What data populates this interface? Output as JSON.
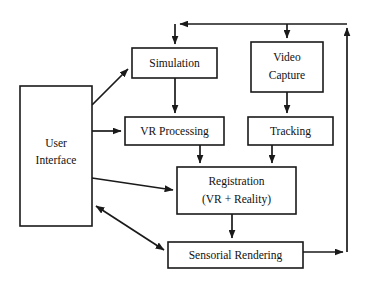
{
  "diagram": {
    "type": "block-flow-diagram",
    "canvas": {
      "width": 368,
      "height": 283,
      "background": "#ffffff"
    },
    "style": {
      "line_color": "#1a1a1a",
      "box_fill": "#ffffff",
      "text_color": "#111111"
    },
    "nodes": [
      {
        "id": "user-interface",
        "label": "User\nInterface",
        "line1": "User",
        "line2": "Interface",
        "x": 20,
        "y": 86,
        "w": 72,
        "h": 140
      },
      {
        "id": "simulation",
        "label": "Simulation",
        "line1": "Simulation",
        "line2": "",
        "x": 132,
        "y": 48,
        "w": 85,
        "h": 30
      },
      {
        "id": "video-capture",
        "label": "Video\nCapture",
        "line1": "Video",
        "line2": "Capture",
        "x": 251,
        "y": 42,
        "w": 72,
        "h": 50
      },
      {
        "id": "vr-processing",
        "label": "VR Processing",
        "line1": "VR Processing",
        "line2": "",
        "x": 125,
        "y": 117,
        "w": 99,
        "h": 28
      },
      {
        "id": "tracking",
        "label": "Tracking",
        "line1": "Tracking",
        "line2": "",
        "x": 248,
        "y": 117,
        "w": 85,
        "h": 28
      },
      {
        "id": "registration",
        "label": "Registration\n(VR + Reality)",
        "line1": "Registration",
        "line2": "(VR + Reality)",
        "x": 177,
        "y": 167,
        "w": 119,
        "h": 47
      },
      {
        "id": "sensorial-rendering",
        "label": "Sensorial Rendering",
        "line1": "Sensorial Rendering",
        "line2": "",
        "x": 168,
        "y": 242,
        "w": 135,
        "h": 26
      }
    ],
    "edges": [
      {
        "id": "ui-to-simulation",
        "from": "user-interface",
        "to": "simulation",
        "arrowheads": "end"
      },
      {
        "id": "ui-to-vr-processing",
        "from": "user-interface",
        "to": "vr-processing",
        "arrowheads": "end"
      },
      {
        "id": "ui-to-registration",
        "from": "user-interface",
        "to": "registration",
        "arrowheads": "end"
      },
      {
        "id": "ui-sensorial-rendering-bidirectional",
        "from": "user-interface",
        "to": "sensorial-rendering",
        "arrowheads": "both"
      },
      {
        "id": "simulation-to-vr-processing",
        "from": "simulation",
        "to": "vr-processing",
        "arrowheads": "end"
      },
      {
        "id": "vr-processing-to-registration",
        "from": "vr-processing",
        "to": "registration",
        "arrowheads": "end"
      },
      {
        "id": "video-capture-to-tracking",
        "from": "video-capture",
        "to": "tracking",
        "arrowheads": "end"
      },
      {
        "id": "tracking-to-registration",
        "from": "tracking",
        "to": "registration",
        "arrowheads": "end"
      },
      {
        "id": "registration-to-sensorial-rendering",
        "from": "registration",
        "to": "sensorial-rendering",
        "arrowheads": "end"
      },
      {
        "id": "sensorial-rendering-to-right-bus",
        "from": "sensorial-rendering",
        "to": "feedback-bus",
        "arrowheads": "end"
      },
      {
        "id": "feedback-bus-up",
        "from": "feedback-bus",
        "to": "top-bus",
        "arrowheads": "end"
      },
      {
        "id": "top-bus-to-simulation",
        "from": "top-bus",
        "to": "simulation",
        "arrowheads": "end"
      },
      {
        "id": "top-bus-to-video-capture",
        "from": "top-bus",
        "to": "video-capture",
        "arrowheads": "end"
      },
      {
        "id": "top-bus-left-terminus",
        "from": "top-bus",
        "to": "simulation-branch",
        "arrowheads": "end"
      }
    ]
  }
}
